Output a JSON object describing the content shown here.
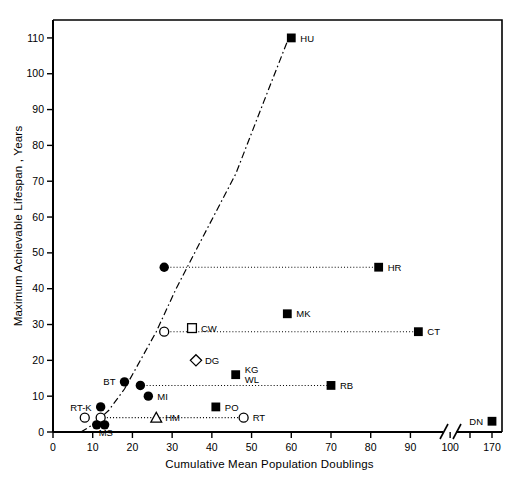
{
  "chart_data": {
    "type": "scatter",
    "title": "",
    "xlabel": "Cumulative Mean Population Doublings",
    "ylabel": "Maximum Achievable Lifespan , Years",
    "xlim": [
      0,
      110
    ],
    "ylim": [
      0,
      115
    ],
    "xticks": [
      0,
      10,
      20,
      30,
      40,
      50,
      60,
      70,
      80,
      90,
      100
    ],
    "xtick_labels": [
      "0",
      "10",
      "20",
      "30",
      "40",
      "50",
      "60",
      "70",
      "80",
      "90",
      "100"
    ],
    "yticks": [
      0,
      10,
      20,
      30,
      40,
      50,
      60,
      70,
      80,
      90,
      100,
      110
    ],
    "ytick_labels": [
      "0",
      "10",
      "20",
      "30",
      "40",
      "50",
      "60",
      "70",
      "80",
      "90",
      "100",
      "110"
    ],
    "axis_break": {
      "present": true,
      "after_value": 105,
      "outlier_tick": 170,
      "outlier_tick_label": "170"
    },
    "grid": false,
    "legend": false,
    "curve": {
      "style": "dash-dot",
      "description": "exponential trend rising to HU",
      "points": [
        [
          7,
          0
        ],
        [
          10,
          2
        ],
        [
          14,
          6
        ],
        [
          18,
          12
        ],
        [
          22,
          20
        ],
        [
          26,
          28
        ],
        [
          31,
          40
        ],
        [
          38,
          55
        ],
        [
          46,
          72
        ],
        [
          53,
          92
        ],
        [
          59,
          109
        ]
      ]
    },
    "points": [
      {
        "label": "HU",
        "x": 60,
        "y": 110,
        "marker": "filled-square",
        "label_pos": "right"
      },
      {
        "label": "HR",
        "x": 82,
        "y": 46,
        "marker": "filled-square",
        "label_pos": "right"
      },
      {
        "label": "",
        "x": 28,
        "y": 46,
        "marker": "filled-circle",
        "label_pos": "none"
      },
      {
        "label": "MK",
        "x": 59,
        "y": 33,
        "marker": "filled-square",
        "label_pos": "right"
      },
      {
        "label": "CT",
        "x": 92,
        "y": 28,
        "marker": "filled-square",
        "label_pos": "right"
      },
      {
        "label": "CW",
        "x": 35,
        "y": 29,
        "marker": "open-square",
        "label_pos": "right"
      },
      {
        "label": "",
        "x": 28,
        "y": 28,
        "marker": "open-circle",
        "label_pos": "none"
      },
      {
        "label": "DG",
        "x": 36,
        "y": 20,
        "marker": "open-diamond",
        "label_pos": "right"
      },
      {
        "label": "KG",
        "x": 46,
        "y": 16,
        "marker": "filled-square",
        "label_pos": "right-upper"
      },
      {
        "label": "WL",
        "x": 46,
        "y": 16,
        "marker": "none",
        "label_pos": "right-lower"
      },
      {
        "label": "RB",
        "x": 70,
        "y": 13,
        "marker": "filled-square",
        "label_pos": "right"
      },
      {
        "label": "BT",
        "x": 18,
        "y": 14,
        "marker": "filled-circle",
        "label_pos": "left"
      },
      {
        "label": "",
        "x": 22,
        "y": 13,
        "marker": "filled-circle",
        "label_pos": "none"
      },
      {
        "label": "MI",
        "x": 24,
        "y": 10,
        "marker": "filled-circle",
        "label_pos": "right"
      },
      {
        "label": "PO",
        "x": 41,
        "y": 7,
        "marker": "filled-square",
        "label_pos": "right"
      },
      {
        "label": "RT-K",
        "x": 12,
        "y": 7,
        "marker": "filled-circle",
        "label_pos": "left"
      },
      {
        "label": "HM",
        "x": 26,
        "y": 4,
        "marker": "open-triangle",
        "label_pos": "right"
      },
      {
        "label": "RT",
        "x": 48,
        "y": 4,
        "marker": "open-circle",
        "label_pos": "right"
      },
      {
        "label": "",
        "x": 8,
        "y": 4,
        "marker": "open-circle",
        "label_pos": "none"
      },
      {
        "label": "",
        "x": 12,
        "y": 4,
        "marker": "open-circle",
        "label_pos": "none"
      },
      {
        "label": "MS",
        "x": 11,
        "y": 2,
        "marker": "filled-circle",
        "label_pos": "below"
      },
      {
        "label": "",
        "x": 13,
        "y": 2,
        "marker": "filled-circle",
        "label_pos": "none"
      },
      {
        "label": "DN",
        "x": 170,
        "y": 3,
        "marker": "filled-square",
        "label_pos": "left"
      }
    ],
    "connectors": [
      {
        "from": [
          28,
          46
        ],
        "to": [
          82,
          46
        ],
        "style": "dotted"
      },
      {
        "from": [
          28,
          28
        ],
        "to": [
          92,
          28
        ],
        "style": "dotted"
      },
      {
        "from": [
          22,
          13
        ],
        "to": [
          70,
          13
        ],
        "style": "dotted"
      },
      {
        "from": [
          12,
          4
        ],
        "to": [
          48,
          4
        ],
        "style": "dotted"
      }
    ]
  }
}
